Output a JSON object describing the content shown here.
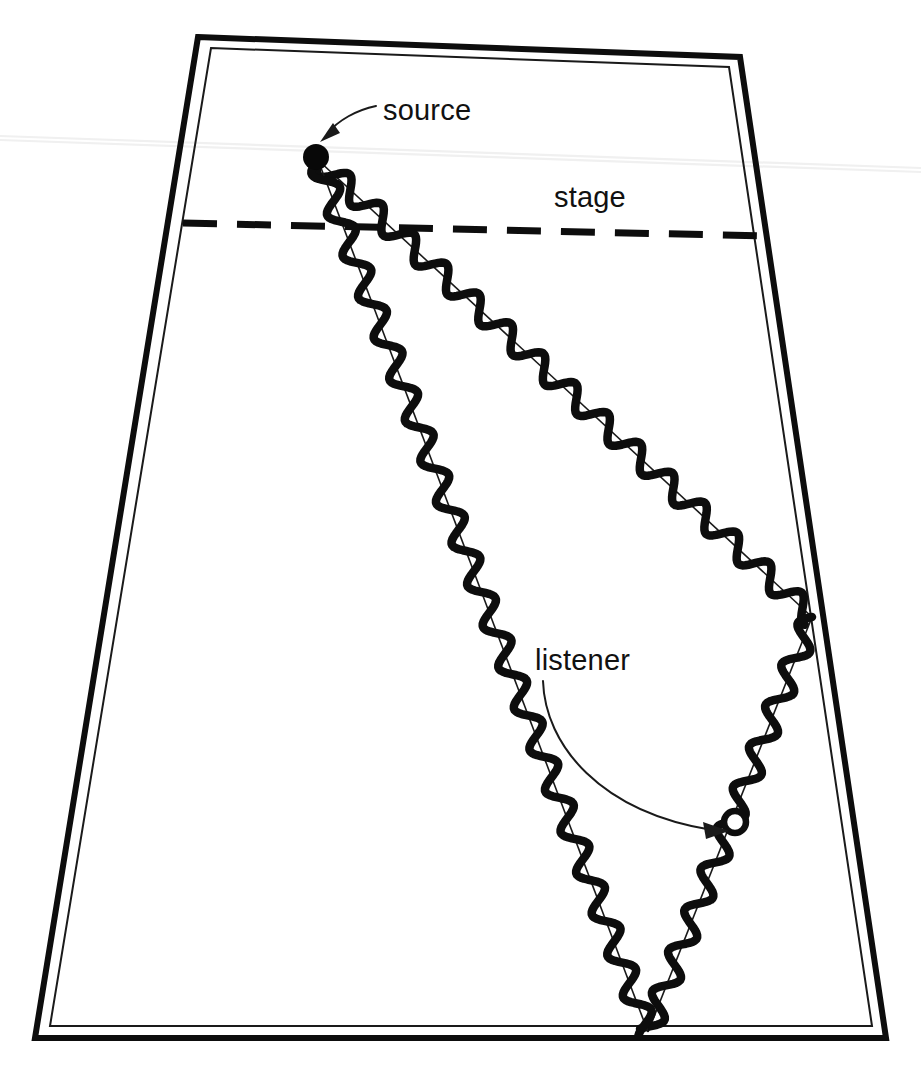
{
  "figure": {
    "background_color": "#ffffff",
    "ink_color": "#0d0d0d",
    "width": 921,
    "height": 1080
  },
  "labels": {
    "source": "source",
    "stage": "stage",
    "listener": "listener"
  },
  "room": {
    "shape": "trapezoid",
    "outer_points": "198,37 740,57 886,1038 35,1038",
    "inner_points": "211,48 729,67 872,1026 50,1026",
    "wall_color": "#0d0d0d"
  },
  "stage_line": {
    "x1": 183,
    "y1": 223,
    "x2": 766,
    "y2": 236,
    "style": "dashed"
  },
  "source_marker": {
    "cx": 316,
    "cy": 157,
    "r": 13,
    "fill": "#080808"
  },
  "listener_marker": {
    "cx": 735,
    "cy": 822,
    "r": 11,
    "fill": "#ffffff"
  },
  "source_label_pos": {
    "x": 383,
    "y": 120
  },
  "stage_label_pos": {
    "x": 554,
    "y": 207
  },
  "listener_label_pos": {
    "x": 535,
    "y": 670
  },
  "source_leader": {
    "path": "M 376 106 C 357 110 338 120 327 134",
    "arrow": "322,140 337,132 333,125"
  },
  "listener_leader": {
    "path": "M 543 681 C 545 745 600 812 712 830",
    "arrow": "727,831 705,823 707,838"
  },
  "chart_data": {
    "type": "scatter",
    "xlabel": "",
    "ylabel": "",
    "annotations": [
      "source",
      "stage",
      "listener"
    ],
    "rays": [
      {
        "name": "ray-a-right-wall",
        "description": "wavy sound ray from source to right wall reflection",
        "points": [
          [
            318,
            160
          ],
          [
            812,
            617
          ]
        ],
        "wavelength": 44,
        "amplitude": 11
      },
      {
        "name": "ray-a-to-listener",
        "description": "reflected ray from right wall down past listener to rear floor",
        "points": [
          [
            812,
            617
          ],
          [
            648,
            1032
          ]
        ],
        "wavelength": 44,
        "amplitude": 11
      },
      {
        "name": "ray-b-direct-down",
        "description": "wavy sound ray from source steeply down to rear floor",
        "points": [
          [
            318,
            160
          ],
          [
            648,
            1032
          ]
        ],
        "wavelength": 44,
        "amplitude": 11
      }
    ],
    "markers": [
      {
        "name": "source",
        "x": 316,
        "y": 157,
        "style": "filled-circle"
      },
      {
        "name": "listener",
        "x": 735,
        "y": 822,
        "style": "open-circle"
      }
    ],
    "reflection_points": [
      {
        "surface": "right-wall",
        "x": 812,
        "y": 617
      },
      {
        "surface": "rear-floor",
        "x": 648,
        "y": 1032
      }
    ]
  }
}
